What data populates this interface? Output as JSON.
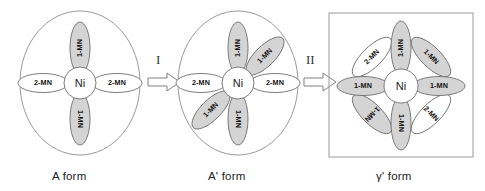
{
  "figure": {
    "title_present": false,
    "ligand_labels": {
      "mono": "1-MN",
      "di": "2-MN"
    },
    "metal_label": "Ni"
  },
  "structures": [
    {
      "id": "a-form",
      "caption": "A form",
      "outline": "circle",
      "center": "Ni",
      "petals": [
        {
          "label": "1-MN",
          "angle": -90,
          "fill": "gray"
        },
        {
          "label": "2-MN",
          "angle": 0,
          "fill": "white"
        },
        {
          "label": "1-MN",
          "angle": 90,
          "fill": "gray"
        },
        {
          "label": "2-MN",
          "angle": 180,
          "fill": "white"
        }
      ]
    },
    {
      "id": "a-prime-form",
      "caption": "A' form",
      "outline": "circle",
      "center": "Ni",
      "petals": [
        {
          "label": "1-MN",
          "angle": -90,
          "fill": "gray"
        },
        {
          "label": "1-MN",
          "angle": -45,
          "fill": "gray"
        },
        {
          "label": "2-MN",
          "angle": 0,
          "fill": "white"
        },
        {
          "label": "1-MN",
          "angle": 90,
          "fill": "gray"
        },
        {
          "label": "1-MN",
          "angle": 135,
          "fill": "gray"
        },
        {
          "label": "2-MN",
          "angle": 180,
          "fill": "white"
        }
      ]
    },
    {
      "id": "gamma-prime-form",
      "caption": "γ' form",
      "outline": "square",
      "center": "Ni",
      "petals": [
        {
          "label": "1-MN",
          "angle": -90,
          "fill": "gray"
        },
        {
          "label": "1-MN",
          "angle": -45,
          "fill": "gray"
        },
        {
          "label": "1-MN",
          "angle": 0,
          "fill": "gray"
        },
        {
          "label": "2-MN",
          "angle": 45,
          "fill": "white"
        },
        {
          "label": "1-MN",
          "angle": 90,
          "fill": "gray"
        },
        {
          "label": "1-MN",
          "angle": 135,
          "fill": "gray"
        },
        {
          "label": "1-MN",
          "angle": 180,
          "fill": "gray"
        },
        {
          "label": "2-MN",
          "angle": 225,
          "fill": "white"
        }
      ]
    }
  ],
  "transitions": [
    {
      "id": "step-1",
      "numeral": "I"
    },
    {
      "id": "step-2",
      "numeral": "II"
    }
  ],
  "colors": {
    "petal_gray_fill": "#d4d4d4",
    "petal_white_fill": "#ffffff",
    "stroke": "#6e6e6e",
    "outline_stroke": "#9a9a9a",
    "text": "#1a1a1a"
  }
}
